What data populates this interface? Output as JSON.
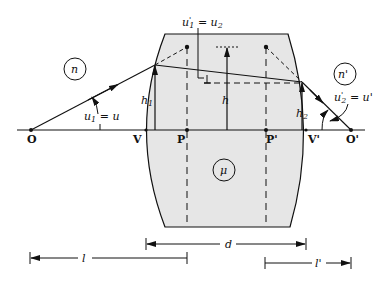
{
  "diagram": {
    "media": {
      "object_space": "n",
      "image_space": "n'",
      "lens": "μ"
    },
    "points": {
      "object": "O",
      "image": "O'",
      "vertex_front": "V",
      "vertex_back": "V'",
      "principal_front": "P",
      "principal_back": "P'"
    },
    "heights": {
      "h1": "h",
      "h1_sub": "1",
      "h": "h",
      "h2": "h",
      "h2_sub": "2"
    },
    "angles": {
      "u1_label": "u",
      "u1_sub": "1",
      "u1_eq": " = u",
      "u1p_label": "u",
      "u1p_sub": "1",
      "u1p_sup": "'",
      "u1p_eq": " = u",
      "u1p_eq_sub": "2",
      "u2p_label": "u",
      "u2p_sub": "2",
      "u2p_sup": "'",
      "u2p_eq": " = u'"
    },
    "dimensions": {
      "lens_separation": "d",
      "object_distance": "l",
      "image_distance": "l'"
    },
    "colors": {
      "lens_fill": "#e6e6e6",
      "line": "#111111"
    }
  }
}
